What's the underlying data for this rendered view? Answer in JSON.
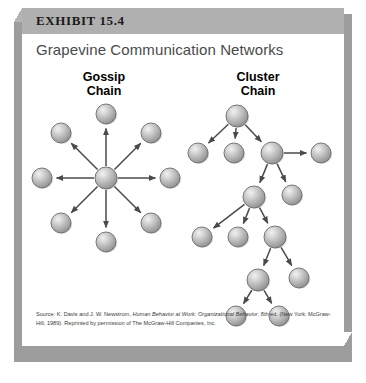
{
  "exhibit": {
    "label": "EXHIBIT 15.4",
    "title": "Grapevine Communication Networks"
  },
  "columns": [
    {
      "name": "gossip-chain",
      "line1": "Gossip",
      "line2": "Chain"
    },
    {
      "name": "cluster-chain",
      "line1": "Cluster",
      "line2": "Chain"
    }
  ],
  "source": {
    "line1_prefix": "Source: K. Davis and J. W. Newstrom, ",
    "line1_italic1": "Human Behavior at Work: Organizational Behavior",
    "line1_suffix": ", 8th ed.",
    "line2": "(New York: McGraw-Hill, 1989). Reprinted by permission of The McGraw-Hill Companies, Inc."
  },
  "colors": {
    "header_bar": "#b0b0b0",
    "title_text": "#4a4a4a",
    "node_fill": "#b9b9b9",
    "node_stroke": "#6b6b6b",
    "arrow": "#4a4a4a",
    "shadow": "#9d9d9d"
  },
  "chart_data": {
    "type": "diagram",
    "title": "Grapevine Communication Networks",
    "diagrams": [
      {
        "name": "Gossip Chain",
        "layout": "radial-star",
        "description": "One central sender transmits to eight receivers simultaneously.",
        "node_count": 9,
        "nodes": [
          {
            "id": "hub",
            "x": 78,
            "y": 78,
            "r": 11
          },
          {
            "id": "n",
            "x": 78,
            "y": 14,
            "r": 10
          },
          {
            "id": "ne",
            "x": 123,
            "y": 33,
            "r": 10
          },
          {
            "id": "e",
            "x": 142,
            "y": 78,
            "r": 10
          },
          {
            "id": "se",
            "x": 123,
            "y": 123,
            "r": 10
          },
          {
            "id": "s",
            "x": 78,
            "y": 142,
            "r": 10
          },
          {
            "id": "sw",
            "x": 33,
            "y": 123,
            "r": 10
          },
          {
            "id": "w",
            "x": 14,
            "y": 78,
            "r": 10
          },
          {
            "id": "nw",
            "x": 33,
            "y": 33,
            "r": 10
          }
        ],
        "edges": [
          {
            "from": "hub",
            "to": "n"
          },
          {
            "from": "hub",
            "to": "ne"
          },
          {
            "from": "hub",
            "to": "e"
          },
          {
            "from": "hub",
            "to": "se"
          },
          {
            "from": "hub",
            "to": "s"
          },
          {
            "from": "hub",
            "to": "sw"
          },
          {
            "from": "hub",
            "to": "w"
          },
          {
            "from": "hub",
            "to": "nw"
          }
        ]
      },
      {
        "name": "Cluster Chain",
        "layout": "cascading-tree",
        "description": "Information passes selectively from person to person in successive clusters.",
        "node_count": 13,
        "nodes": [
          {
            "id": "a",
            "x": 55,
            "y": 16,
            "r": 11
          },
          {
            "id": "b",
            "x": 16,
            "y": 53,
            "r": 10
          },
          {
            "id": "c",
            "x": 52,
            "y": 53,
            "r": 10
          },
          {
            "id": "d",
            "x": 90,
            "y": 53,
            "r": 11
          },
          {
            "id": "e",
            "x": 139,
            "y": 53,
            "r": 10
          },
          {
            "id": "f",
            "x": 72,
            "y": 97,
            "r": 11
          },
          {
            "id": "g",
            "x": 110,
            "y": 95,
            "r": 10
          },
          {
            "id": "h",
            "x": 20,
            "y": 137,
            "r": 10
          },
          {
            "id": "i",
            "x": 56,
            "y": 137,
            "r": 10
          },
          {
            "id": "j",
            "x": 93,
            "y": 137,
            "r": 11
          },
          {
            "id": "k",
            "x": 76,
            "y": 180,
            "r": 11
          },
          {
            "id": "l",
            "x": 117,
            "y": 178,
            "r": 10
          },
          {
            "id": "m",
            "x": 54,
            "y": 216,
            "r": 10
          },
          {
            "id": "n",
            "x": 97,
            "y": 216,
            "r": 10
          }
        ],
        "edges": [
          {
            "from": "a",
            "to": "b"
          },
          {
            "from": "a",
            "to": "c"
          },
          {
            "from": "a",
            "to": "d"
          },
          {
            "from": "d",
            "to": "e"
          },
          {
            "from": "d",
            "to": "f"
          },
          {
            "from": "d",
            "to": "g"
          },
          {
            "from": "f",
            "to": "h"
          },
          {
            "from": "f",
            "to": "i"
          },
          {
            "from": "f",
            "to": "j"
          },
          {
            "from": "j",
            "to": "k"
          },
          {
            "from": "j",
            "to": "l"
          },
          {
            "from": "k",
            "to": "m"
          },
          {
            "from": "k",
            "to": "n"
          }
        ]
      }
    ]
  }
}
